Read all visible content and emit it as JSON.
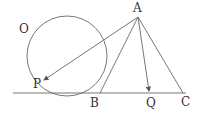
{
  "diagram": {
    "labels": {
      "O": "O",
      "A": "A",
      "P": "P",
      "B": "B",
      "Q": "Q",
      "C": "C"
    },
    "colors": {
      "stroke": "#555555",
      "text": "#333333"
    }
  }
}
